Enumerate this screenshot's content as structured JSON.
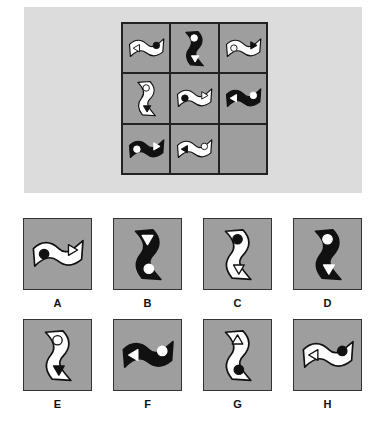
{
  "puzzle": {
    "type": "3x3 matrix completion",
    "colors": {
      "panel": "#dcdcdc",
      "cell": "#9e9e9e",
      "border": "#222222",
      "black": "#111111",
      "white": "#ffffff"
    },
    "grid": [
      {
        "row": 0,
        "col": 0,
        "orientation": "horizontal",
        "fill": "white",
        "left": "triangle-left-outline",
        "right": "circle-black"
      },
      {
        "row": 0,
        "col": 1,
        "orientation": "vertical",
        "fill": "black",
        "top": "circle-white",
        "bottom": "triangle-down-white"
      },
      {
        "row": 0,
        "col": 2,
        "orientation": "horizontal",
        "fill": "white",
        "left": "circle-outline",
        "right": "triangle-right-black"
      },
      {
        "row": 1,
        "col": 0,
        "orientation": "vertical",
        "fill": "white",
        "top": "circle-outline",
        "bottom": "triangle-down-black"
      },
      {
        "row": 1,
        "col": 1,
        "orientation": "horizontal",
        "fill": "white",
        "left": "circle-black",
        "right": "triangle-right-outline"
      },
      {
        "row": 1,
        "col": 2,
        "orientation": "horizontal",
        "fill": "black",
        "left": "triangle-left-white",
        "right": "circle-white"
      },
      {
        "row": 2,
        "col": 0,
        "orientation": "horizontal",
        "fill": "black",
        "left": "circle-white",
        "right": "triangle-right-white"
      },
      {
        "row": 2,
        "col": 1,
        "orientation": "horizontal",
        "fill": "white",
        "left": "triangle-left-black",
        "right": "circle-outline"
      },
      {
        "row": 2,
        "col": 2,
        "empty": true
      }
    ],
    "options": [
      {
        "label": "A",
        "orientation": "horizontal",
        "fill": "white",
        "left": "circle-black",
        "right": "triangle-right-outline"
      },
      {
        "label": "B",
        "orientation": "vertical",
        "fill": "black",
        "top": "triangle-down-white",
        "bottom": "circle-white"
      },
      {
        "label": "C",
        "orientation": "vertical",
        "fill": "white",
        "top": "circle-black",
        "bottom": "triangle-down-outline"
      },
      {
        "label": "D",
        "orientation": "vertical",
        "fill": "black",
        "top": "circle-white",
        "bottom": "triangle-down-white"
      },
      {
        "label": "E",
        "orientation": "vertical",
        "fill": "white",
        "top": "circle-outline",
        "bottom": "triangle-down-black"
      },
      {
        "label": "F",
        "orientation": "horizontal",
        "fill": "black",
        "left": "triangle-left-white",
        "right": "circle-white"
      },
      {
        "label": "G",
        "orientation": "vertical",
        "fill": "white",
        "top": "triangle-up-outline",
        "bottom": "circle-black"
      },
      {
        "label": "H",
        "orientation": "horizontal",
        "fill": "white",
        "left": "triangle-left-outline",
        "right": "circle-black"
      }
    ]
  }
}
